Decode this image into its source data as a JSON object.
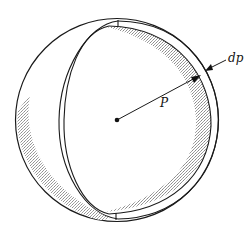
{
  "figure": {
    "type": "spherical-shell-diagram",
    "labels": {
      "radius": "P",
      "thickness": "dp"
    },
    "colors": {
      "stroke": "#1a1a1a",
      "shade": "#bdbdbd",
      "background": "#ffffff"
    }
  }
}
